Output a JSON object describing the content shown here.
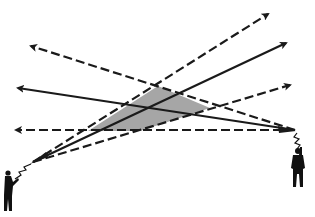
{
  "diagram": {
    "type": "beam-overlap",
    "colors": {
      "line": "#1a1a1a",
      "overlap_fill": "#a6a6a6",
      "figure": "#111111",
      "background": "#ffffff"
    },
    "left_source": {
      "label": "",
      "apex": [
        33,
        162
      ],
      "beams": [
        {
          "style": "dashed",
          "to": [
            268,
            14
          ]
        },
        {
          "style": "solid",
          "to": [
            286,
            43
          ]
        },
        {
          "style": "dashed",
          "to": [
            290,
            85
          ]
        }
      ]
    },
    "right_source": {
      "label": "",
      "apex": [
        295,
        130
      ],
      "beams": [
        {
          "style": "dashed",
          "to": [
            31,
            46
          ]
        },
        {
          "style": "solid",
          "to": [
            18,
            88
          ]
        },
        {
          "style": "dashed",
          "to": [
            16,
            130
          ]
        }
      ]
    },
    "overlap_region": {
      "points": [
        [
          88,
          131
        ],
        [
          158,
          86
        ],
        [
          210,
          108
        ],
        [
          140,
          131
        ]
      ]
    }
  }
}
